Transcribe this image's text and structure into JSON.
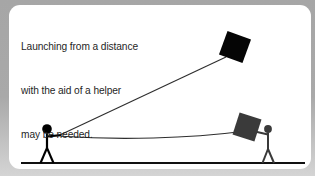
{
  "figure": {
    "type": "instructional-illustration",
    "card_background": "#ffffff",
    "outer_background": "#a8a8a8",
    "ink_color": "#000000"
  },
  "caption": {
    "lines": [
      "Launching from a distance",
      "with the aid of a helper",
      "may be needed."
    ],
    "color": "#1f1f1f"
  },
  "scene": {
    "ground": {
      "label": "ground-line",
      "color": "#111111",
      "y": 158,
      "x_start": 12,
      "x_end": 296
    },
    "flying_kite": {
      "label": "kite-in-air",
      "color": "#050505",
      "center_x": 226,
      "center_y": 42,
      "size": 25,
      "rotation_deg": 20
    },
    "held_kite": {
      "label": "kite-held-by-helper",
      "color": "#3a3a3a",
      "center_x": 238,
      "center_y": 122,
      "size": 23,
      "rotation_deg": 18
    },
    "flyer": {
      "label": "kite-flyer-stick-figure",
      "color": "#000000",
      "head_x": 38,
      "head_y": 124,
      "head_r": 4.6,
      "ground_y": 158
    },
    "helper": {
      "label": "helper-stick-figure",
      "color": "#3a3a3a",
      "head_x": 259,
      "head_y": 124,
      "head_r": 3.6,
      "ground_y": 158
    },
    "kite_line": {
      "label": "kite-string-to-sky",
      "color": "#2b2b2b",
      "from_x": 52,
      "from_y": 129,
      "to_x": 216,
      "to_y": 52
    },
    "helper_line": {
      "label": "kite-string-to-helper",
      "color": "#2b2b2b",
      "from_x": 52,
      "from_y": 131,
      "to_x": 232,
      "to_y": 126
    }
  }
}
